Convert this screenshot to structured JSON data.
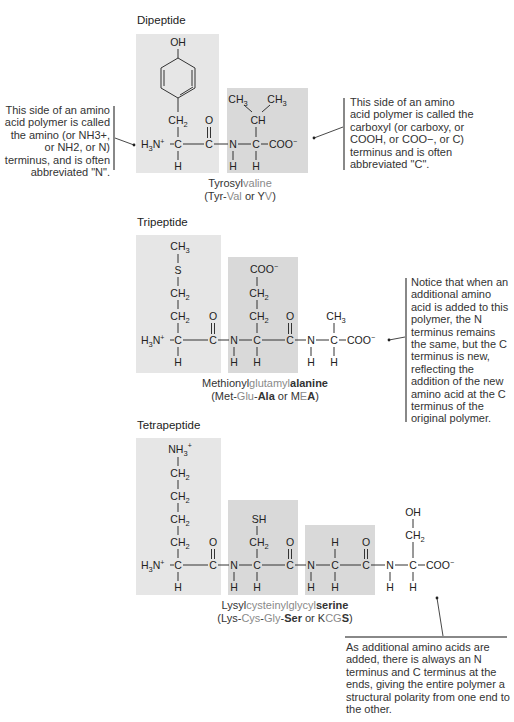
{
  "panels": {
    "dipeptide": {
      "title": "Dipeptide",
      "name_parts": [
        {
          "text": "Tyrosyl",
          "tone": "dark"
        },
        {
          "text": "valine",
          "tone": "light"
        }
      ],
      "abbr_parts": [
        {
          "text": "(Tyr-",
          "tone": "dark"
        },
        {
          "text": "Val",
          "tone": "light"
        },
        {
          "text": " or Y",
          "tone": "dark"
        },
        {
          "text": "V",
          "tone": "light"
        },
        {
          "text": ")",
          "tone": "dark"
        }
      ]
    },
    "tripeptide": {
      "title": "Tripeptide",
      "name_parts": [
        {
          "text": "Methionyl",
          "tone": "dark"
        },
        {
          "text": "glutamyl",
          "tone": "light"
        },
        {
          "text": "alanine",
          "tone": "bold"
        }
      ],
      "abbr_parts": [
        {
          "text": "(Met-",
          "tone": "dark"
        },
        {
          "text": "Glu",
          "tone": "light"
        },
        {
          "text": "-",
          "tone": "dark"
        },
        {
          "text": "Ala",
          "tone": "bold"
        },
        {
          "text": " or M",
          "tone": "dark"
        },
        {
          "text": "E",
          "tone": "light"
        },
        {
          "text": "A",
          "tone": "bold"
        },
        {
          "text": ")",
          "tone": "dark"
        }
      ]
    },
    "tetrapeptide": {
      "title": "Tetrapeptide",
      "name_parts": [
        {
          "text": "Lysyl",
          "tone": "dark"
        },
        {
          "text": "cysteinyl",
          "tone": "light"
        },
        {
          "text": "glycyl",
          "tone": "light"
        },
        {
          "text": "serine",
          "tone": "bold"
        }
      ],
      "abbr_parts": [
        {
          "text": "(Lys-",
          "tone": "dark"
        },
        {
          "text": "Cys",
          "tone": "light"
        },
        {
          "text": "-",
          "tone": "dark"
        },
        {
          "text": "Gly",
          "tone": "light"
        },
        {
          "text": "-",
          "tone": "dark"
        },
        {
          "text": "Ser",
          "tone": "bold"
        },
        {
          "text": " or K",
          "tone": "dark"
        },
        {
          "text": "CG",
          "tone": "light"
        },
        {
          "text": "S",
          "tone": "bold"
        },
        {
          "text": ")",
          "tone": "dark"
        }
      ]
    }
  },
  "callouts": {
    "n_terminus": "This side of an amino acid polymer is called the amino (or NH3+, or NH2, or N) terminus, and is often abbreviated \"N\".",
    "c_terminus": "This side of an amino acid polymer is called the carboxyl (or carboxy, or COOH, or COO−, or C) terminus and is often abbreviated \"C\".",
    "new_c_terminus": "Notice that when an additional amino acid is added to this polymer, the N terminus remains the same, but the C terminus is new, reflecting the addition of the new amino acid at the C terminus of the original polymer.",
    "polarity": "As additional amino acids are added, there is always an N terminus and C terminus at the ends, giving the entire polymer a structural polarity from one end to the other."
  },
  "colors": {
    "box_light": "#e6e6e6",
    "box_dark": "#d9d9d9",
    "text_dark": "#333333",
    "text_light": "#8a8a8a"
  }
}
